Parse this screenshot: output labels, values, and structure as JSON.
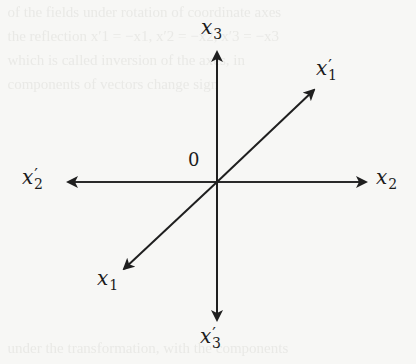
{
  "diagram": {
    "type": "coordinate-axes",
    "origin_label": "0",
    "axes": [
      {
        "id": "x3",
        "var": "x",
        "sub": "3",
        "prime": "",
        "direction": "up"
      },
      {
        "id": "x3p",
        "var": "x",
        "sub": "3",
        "prime": "′",
        "direction": "down"
      },
      {
        "id": "x2",
        "var": "x",
        "sub": "2",
        "prime": "",
        "direction": "right"
      },
      {
        "id": "x2p",
        "var": "x",
        "sub": "2",
        "prime": "′",
        "direction": "left"
      },
      {
        "id": "x1",
        "var": "x",
        "sub": "1",
        "prime": "",
        "direction": "down-left"
      },
      {
        "id": "x1p",
        "var": "x",
        "sub": "1",
        "prime": "′",
        "direction": "up-right"
      }
    ],
    "colors": {
      "line": "#1f1f1f",
      "background": "#f7f7f5"
    }
  }
}
